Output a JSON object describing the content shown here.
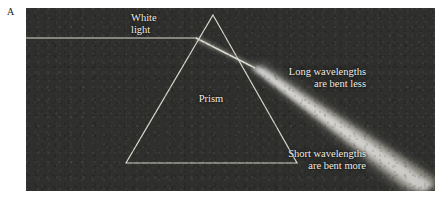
{
  "figure": {
    "panel_letter": "A",
    "background_color": "#ffffff",
    "panel_color": "#2f2f2d",
    "line_color": "#d8d6cb",
    "text_color": "#efeee7",
    "panel": {
      "x": 26,
      "y": 8,
      "width": 409,
      "height": 183
    }
  },
  "captions": {
    "white_light": {
      "line1": "White",
      "line2": "light"
    },
    "prism": {
      "line1": "Prism"
    },
    "long_wavelengths": {
      "line1": "Long wavelengths",
      "line2": "are bent less"
    },
    "short_wavelengths": {
      "line1": "Short wavelengths",
      "line2": "are bent more"
    }
  },
  "geometry": {
    "prism": {
      "apex": [
        187,
        7
      ],
      "bottom_left": [
        100,
        155
      ],
      "bottom_right": [
        271,
        155
      ]
    },
    "incident_ray": {
      "from": [
        0,
        30
      ],
      "to": [
        170,
        30
      ]
    },
    "entry_point": [
      170,
      30
    ],
    "exit_point": [
      226,
      63
    ],
    "dispersed_beam": {
      "from": [
        226,
        63
      ],
      "to": [
        409,
        183
      ]
    }
  }
}
